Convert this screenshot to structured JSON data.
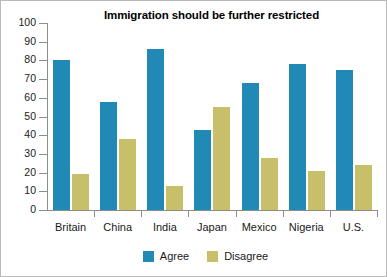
{
  "chart_data": {
    "type": "bar",
    "title": "Immigration should be further restricted",
    "xlabel": "",
    "ylabel": "",
    "ylim": [
      0,
      100
    ],
    "yticks": [
      0,
      10,
      20,
      30,
      40,
      50,
      60,
      70,
      80,
      90,
      100
    ],
    "grid": false,
    "legend_position": "bottom-center",
    "categories": [
      "Britain",
      "China",
      "India",
      "Japan",
      "Mexico",
      "Nigeria",
      "U.S."
    ],
    "series": [
      {
        "name": "Agree",
        "color": "#2089b5",
        "values": [
          80,
          58,
          86,
          43,
          68,
          78,
          75
        ]
      },
      {
        "name": "Disagree",
        "color": "#c8bf6b",
        "values": [
          19,
          38,
          13,
          55,
          28,
          21,
          24
        ]
      }
    ]
  },
  "legend": {
    "items": [
      {
        "label": "Agree",
        "color": "#2089b5"
      },
      {
        "label": "Disagree",
        "color": "#c8bf6b"
      }
    ]
  }
}
